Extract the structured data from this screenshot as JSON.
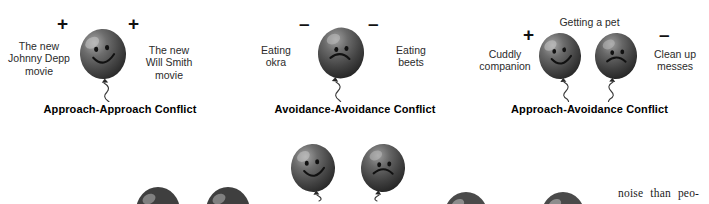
{
  "figure": {
    "title_semantic": "types-of-motivational-conflict",
    "background_color": "#ffffff",
    "balloon_color": "#4a4a4a",
    "balloon_dark": "#2e2e2e",
    "balloon_highlight": "#cfcfcf",
    "ink_color": "#111111"
  },
  "panels": [
    {
      "id": "approach-approach",
      "caption": "Approach-Approach Conflict",
      "top_label": "",
      "signs": [
        "+",
        "+"
      ],
      "left_label": "The new\nJohnny Depp\nmovie",
      "right_label": "The new\nWill Smith\nmovie",
      "balloons": [
        {
          "face": "happy",
          "tilt": -4
        }
      ]
    },
    {
      "id": "avoidance-avoidance",
      "caption": "Avoidance-Avoidance Conflict",
      "top_label": "",
      "signs": [
        "–",
        "–"
      ],
      "left_label": "Eating\nokra",
      "right_label": "Eating\nbeets",
      "balloons": [
        {
          "face": "sad",
          "tilt": 6
        }
      ]
    },
    {
      "id": "approach-avoidance",
      "caption": "Approach-Avoidance Conflict",
      "top_label": "Getting a pet",
      "signs": [
        "+",
        "–"
      ],
      "left_label": "Cuddly\ncompanion",
      "right_label": "Clean up\nmesses",
      "balloons": [
        {
          "face": "happy",
          "tilt": -3
        },
        {
          "face": "sad",
          "tilt": 4
        }
      ]
    }
  ],
  "second_row": {
    "description_semantic": "partially-cropped-balloon-row",
    "balloons": [
      {
        "face": "happy",
        "state": "full"
      },
      {
        "face": "sad",
        "state": "full"
      },
      {
        "face": "none",
        "state": "cropped"
      },
      {
        "face": "none",
        "state": "cropped"
      },
      {
        "face": "none",
        "state": "cropped"
      },
      {
        "face": "none",
        "state": "cropped"
      }
    ]
  },
  "body_text": {
    "line_1_words": [
      "noise",
      "than",
      "peo-"
    ],
    "line_1": "noise than peo-"
  }
}
